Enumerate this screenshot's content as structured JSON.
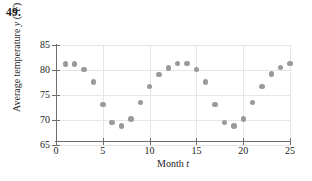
{
  "problem": {
    "number": "49."
  },
  "chart_data": {
    "type": "scatter",
    "title": "",
    "xlabel": "Month t",
    "ylabel": "Average temperature y (°F)",
    "xlabel_text": "Month",
    "xlabel_var": "t",
    "ylabel_text": "Average temperature",
    "ylabel_var": "y",
    "ylabel_units": "(°F)",
    "xlim": [
      0,
      25
    ],
    "ylim": [
      65,
      85
    ],
    "grid": true,
    "legend": "none",
    "xticks": [
      0,
      5,
      10,
      15,
      20,
      25
    ],
    "yticks": [
      65,
      70,
      75,
      80,
      85
    ],
    "xtick_labels": [
      "0",
      "5",
      "10",
      "15",
      "20",
      "25"
    ],
    "ytick_labels": [
      "65",
      "70",
      "75",
      "80",
      "85"
    ],
    "x": [
      1,
      2,
      3,
      4,
      5,
      6,
      7,
      8,
      9,
      10,
      11,
      12,
      13,
      14,
      15,
      16,
      17,
      18,
      19,
      20,
      21,
      22,
      23,
      24,
      25
    ],
    "values": [
      81.2,
      81.2,
      80.1,
      77.6,
      73.1,
      69.5,
      68.8,
      70.2,
      73.5,
      76.7,
      79.1,
      80.4,
      81.3,
      81.3,
      80.1,
      77.6,
      73.1,
      69.5,
      68.8,
      70.2,
      73.5,
      76.7,
      79.2,
      80.5,
      81.3
    ],
    "point_color": "#9a9a9a",
    "axis_color": "#6e6e6e",
    "grid_color": "#e6e6e6"
  }
}
